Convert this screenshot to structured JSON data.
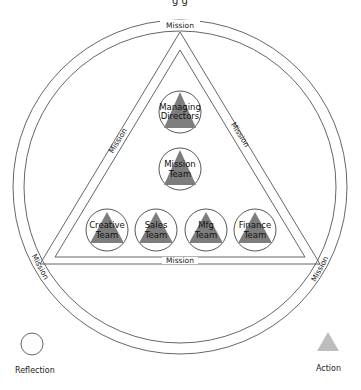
{
  "title_fragment": "g           g",
  "outer_ring": {
    "label_top": "Mission",
    "label_left": "Mission",
    "label_right": "Mission"
  },
  "triangle": {
    "label_left": "Mission",
    "label_right": "Mission",
    "label_bottom": "Mission"
  },
  "nodes": [
    {
      "id": "managing-directors",
      "line1": "Managing",
      "line2": "Directors"
    },
    {
      "id": "mission-team",
      "line1": "Mission",
      "line2": "Team"
    },
    {
      "id": "creative-team",
      "line1": "Creative",
      "line2": "Team"
    },
    {
      "id": "sales-team",
      "line1": "Sales",
      "line2": "Team"
    },
    {
      "id": "mfg-team",
      "line1": "Mfg",
      "line2": "Team"
    },
    {
      "id": "finance-team",
      "line1": "Finance",
      "line2": "Team"
    }
  ],
  "legend": {
    "reflection": {
      "label": "Reflection",
      "icon": "circle-icon"
    },
    "action": {
      "label": "Action",
      "icon": "triangle-icon",
      "color": "#bdbdbd"
    }
  },
  "colors": {
    "line": "#555555",
    "node_triangle": "#7d7d7d",
    "legend_triangle": "#bdbdbd"
  }
}
